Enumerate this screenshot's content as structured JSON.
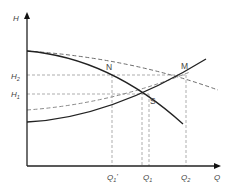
{
  "diagram": {
    "axes": {
      "y_label": "H",
      "x_label": "Q"
    },
    "h_ticks": [
      {
        "id": "H2",
        "base": "H",
        "sub": "2"
      },
      {
        "id": "H1",
        "base": "H",
        "sub": "1"
      }
    ],
    "q_ticks": [
      {
        "id": "Q1prime",
        "base": "Q",
        "sub": "1",
        "prime": "'"
      },
      {
        "id": "Q1",
        "base": "Q",
        "sub": "1"
      },
      {
        "id": "Q2",
        "base": "Q",
        "sub": "2"
      }
    ],
    "points": {
      "N": "N",
      "M": "M",
      "S": "S"
    },
    "colors": {
      "axis": "#222222",
      "solid_curve": "#222222",
      "dashed_curve": "#777777",
      "guide": "#888888",
      "text": "#444444"
    }
  }
}
